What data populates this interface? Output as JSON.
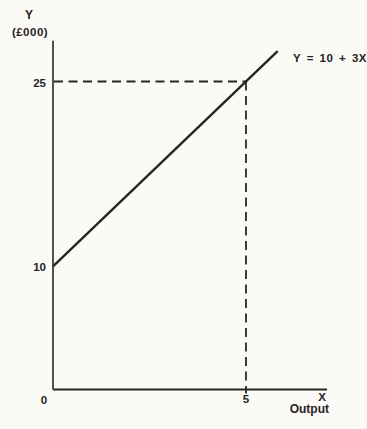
{
  "chart_data": {
    "type": "line",
    "title": "",
    "equation_label": "Y = 10 + 3X",
    "y_axis": {
      "title": "Y",
      "units": "(£000)",
      "ticks": [
        {
          "value": 25,
          "label": "25"
        },
        {
          "value": 10,
          "label": "10"
        },
        {
          "value": 0,
          "label": "0"
        }
      ],
      "range_drawn": [
        0,
        28.3
      ]
    },
    "x_axis": {
      "title": "X",
      "units": "Output",
      "ticks": [
        {
          "value": 5,
          "label": "5"
        }
      ],
      "range_drawn": [
        0,
        7.1
      ]
    },
    "series": [
      {
        "name": "Y = 10 + 3X",
        "intercept": 10,
        "slope": 3,
        "x_start": 0,
        "x_end": 5.82,
        "points": [
          [
            0,
            10
          ],
          [
            5,
            25
          ]
        ]
      }
    ],
    "guide_point": {
      "x": 5,
      "y": 25
    },
    "grid": false,
    "legend": "none",
    "colors": {
      "ink": "#262626",
      "background": "#fbfaf7"
    }
  }
}
